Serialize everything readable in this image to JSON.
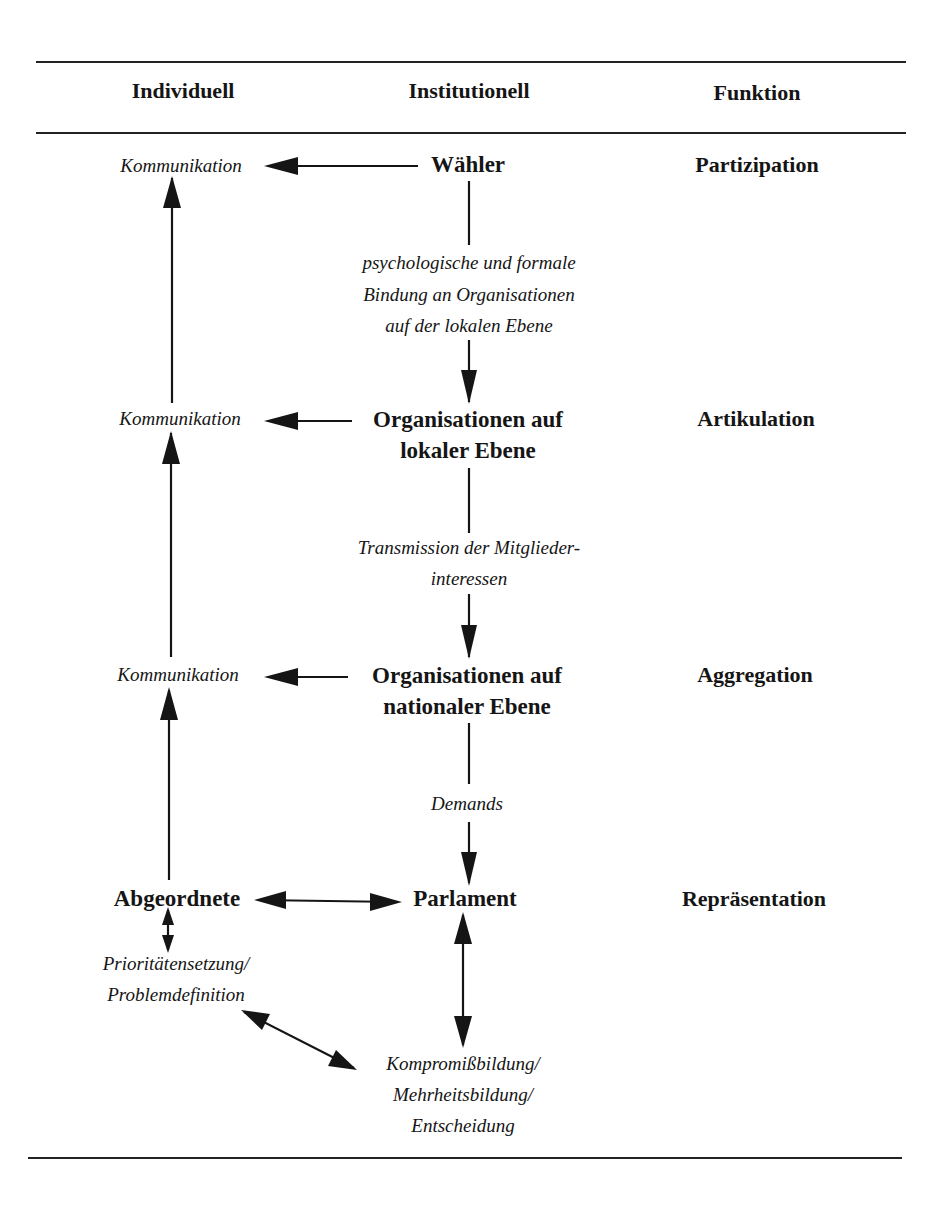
{
  "headers": {
    "individual": "Individuell",
    "institutional": "Institutionell",
    "function": "Funktion"
  },
  "individual": {
    "communication_1": "Kommunikation",
    "communication_2": "Kommunikation",
    "communication_3": "Kommunikation",
    "deputies": "Abgeordnete",
    "priority_line1": "Prioritätensetzung/",
    "priority_line2": "Problemdefinition"
  },
  "institutional": {
    "voters": "Wähler",
    "link1_line1": "psychologische und formale",
    "link1_line2": "Bindung an Organisationen",
    "link1_line3": "auf der lokalen Ebene",
    "local_org_line1": "Organisationen auf",
    "local_org_line2": "lokaler Ebene",
    "link2_line1": "Transmission der Mitglieder-",
    "link2_line2": "interessen",
    "national_org_line1": "Organisationen auf",
    "national_org_line2": "nationaler Ebene",
    "link3": "Demands",
    "parliament": "Parlament",
    "decision_line1": "Kompromißbildung/",
    "decision_line2": "Mehrheitsbildung/",
    "decision_line3": "Entscheidung"
  },
  "functions": {
    "participation": "Partizipation",
    "articulation": "Artikulation",
    "aggregation": "Aggregation",
    "representation": "Repräsentation"
  },
  "arrows": [
    {
      "from": "Wähler",
      "to": "Kommunikation (1)",
      "type": "single"
    },
    {
      "from": "Organisationen auf lokaler Ebene",
      "to": "Kommunikation (2)",
      "type": "single"
    },
    {
      "from": "Organisationen auf nationaler Ebene",
      "to": "Kommunikation (3)",
      "type": "single"
    },
    {
      "from": "Wähler",
      "to": "Organisationen auf lokaler Ebene",
      "type": "single"
    },
    {
      "from": "Organisationen auf lokaler Ebene",
      "to": "Organisationen auf nationaler Ebene",
      "type": "single"
    },
    {
      "from": "Organisationen auf nationaler Ebene",
      "to": "Parlament",
      "type": "single"
    },
    {
      "from": "Kommunikation (2)",
      "to": "Kommunikation (1)",
      "type": "single"
    },
    {
      "from": "Kommunikation (3)",
      "to": "Kommunikation (2)",
      "type": "single"
    },
    {
      "from": "Abgeordnete",
      "to": "Kommunikation (3)",
      "type": "single"
    },
    {
      "from": "Abgeordnete",
      "to": "Parlament",
      "type": "double"
    },
    {
      "from": "Abgeordnete",
      "to": "Prioritätensetzung/Problemdefinition",
      "type": "double"
    },
    {
      "from": "Parlament",
      "to": "Kompromißbildung/Mehrheitsbildung/Entscheidung",
      "type": "double"
    },
    {
      "from": "Prioritätensetzung/Problemdefinition",
      "to": "Kompromißbildung/Mehrheitsbildung/Entscheidung",
      "type": "double"
    }
  ]
}
